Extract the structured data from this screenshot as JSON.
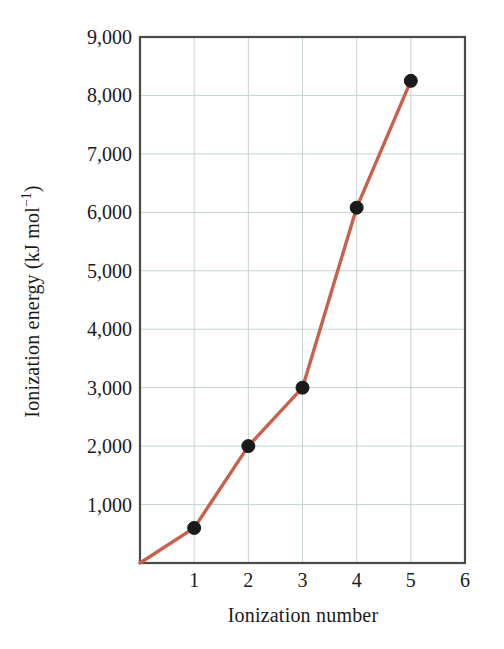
{
  "chart_data": {
    "type": "line",
    "title": "",
    "subtitle": "",
    "xlabel": "Ionization number",
    "ylabel": "Ionization energy (kJ mol−1)",
    "ylabel_base": "Ionization energy (kJ mol",
    "ylabel_exponent": "−1",
    "ylabel_tail": ")",
    "x": [
      1,
      2,
      3,
      4,
      5
    ],
    "values": [
      600,
      2000,
      3000,
      6080,
      8250
    ],
    "series": [
      {
        "name": "Ionization energy",
        "x": [
          1,
          2,
          3,
          4,
          5
        ],
        "values": [
          600,
          2000,
          3000,
          6080,
          8250
        ]
      }
    ],
    "line_start_point": {
      "x": 0,
      "y": 0
    },
    "xlim": [
      0,
      6
    ],
    "ylim": [
      0,
      9000
    ],
    "xticks": [
      1,
      2,
      3,
      4,
      5,
      6
    ],
    "xtick_labels": [
      "1",
      "2",
      "3",
      "4",
      "5",
      "6"
    ],
    "yticks": [
      1000,
      2000,
      3000,
      4000,
      5000,
      6000,
      7000,
      8000,
      9000
    ],
    "ytick_labels": [
      "1,000",
      "2,000",
      "3,000",
      "4,000",
      "5,000",
      "6,000",
      "7,000",
      "8,000",
      "9,000"
    ],
    "grid": true,
    "grid_color": "#c6d4d4",
    "legend": false,
    "legend_position": "none",
    "line_color": "#c8604c",
    "marker_color": "#1a1a1a",
    "marker_shape": "circle",
    "axis_color": "#4a4a4a",
    "background_color": "#ffffff",
    "annotations": []
  },
  "figure": {
    "frame_label": "plot-frame",
    "caption": ""
  }
}
